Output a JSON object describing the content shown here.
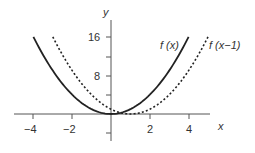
{
  "chart_data": {
    "type": "line",
    "title": "",
    "xlabel": "x",
    "ylabel": "y",
    "xlim": [
      -5,
      5
    ],
    "ylim": [
      -4,
      20
    ],
    "x_ticks": [
      -4,
      -2,
      2,
      4
    ],
    "y_ticks": [
      8,
      16
    ],
    "y_minor_ticks": [
      -4,
      4,
      12
    ],
    "grid": false,
    "series": [
      {
        "name": "f(x)",
        "style": "solid",
        "formula": "x^2",
        "x": [
          -4,
          -3,
          -2,
          -1,
          0,
          1,
          2,
          3,
          4
        ],
        "values": [
          16,
          9,
          4,
          1,
          0,
          1,
          4,
          9,
          16
        ]
      },
      {
        "name": "f(x-1)",
        "style": "dashed",
        "formula": "(x-1)^2",
        "x": [
          -3,
          -2,
          -1,
          0,
          1,
          2,
          3,
          4,
          5
        ],
        "values": [
          16,
          9,
          4,
          1,
          0,
          1,
          4,
          9,
          16
        ]
      }
    ],
    "annotations": [
      "f (x)",
      "f (x−1)"
    ]
  },
  "labels": {
    "y_axis": "y",
    "x_axis": "x",
    "tick_16": "16",
    "tick_8": "8",
    "tick_m4": "−4",
    "tick_m2": "−2",
    "tick_2": "2",
    "tick_4": "4",
    "curve1": "f (x)",
    "curve2": "f (x−1)"
  }
}
